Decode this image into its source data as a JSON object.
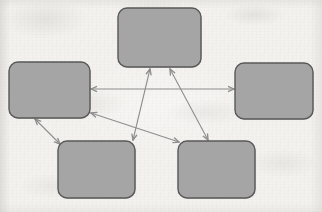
{
  "document": {
    "type": "scanned-diagram",
    "title": "Five-node bidirectional relationship diagram",
    "background_color": "#f3f2ef",
    "paper_texture": "scanned paper with faint gray smudges"
  },
  "style": {
    "node_fill": "#a5a5a5",
    "node_stroke": "#585858",
    "node_stroke_width": 1.4,
    "node_corner_radius": 9,
    "arrow_color": "#8e8e8e",
    "arrow_stroke_width": 1.1,
    "arrowhead_length": 6
  },
  "nodes": [
    {
      "id": "node-top",
      "label": "",
      "position": "top-center",
      "x": 118,
      "y": 8,
      "width": 83,
      "height": 59
    },
    {
      "id": "node-left",
      "label": "",
      "position": "middle-left",
      "x": 9,
      "y": 62,
      "width": 81,
      "height": 56
    },
    {
      "id": "node-right",
      "label": "",
      "position": "middle-right",
      "x": 235,
      "y": 63,
      "width": 78,
      "height": 56
    },
    {
      "id": "node-bottom-left",
      "label": "",
      "position": "bottom-left",
      "x": 58,
      "y": 141,
      "width": 77,
      "height": 57
    },
    {
      "id": "node-bottom-right",
      "label": "",
      "position": "bottom-right",
      "x": 178,
      "y": 141,
      "width": 77,
      "height": 57
    }
  ],
  "connectors": [
    {
      "id": "connector-left-right",
      "from": "node-left",
      "to": "node-right",
      "direction": "bidirectional",
      "x1": 91,
      "y1": 89,
      "x2": 234,
      "y2": 89
    },
    {
      "id": "connector-top-bottomleft",
      "from": "node-top",
      "to": "node-bottom-left",
      "direction": "bidirectional",
      "x1": 150,
      "y1": 69,
      "x2": 133,
      "y2": 140
    },
    {
      "id": "connector-top-bottomright",
      "from": "node-top",
      "to": "node-bottom-right",
      "direction": "bidirectional",
      "x1": 170,
      "y1": 69,
      "x2": 208,
      "y2": 140
    },
    {
      "id": "connector-left-bottomright",
      "from": "node-left",
      "to": "node-bottom-right",
      "direction": "bidirectional",
      "x1": 91,
      "y1": 113,
      "x2": 179,
      "y2": 142
    },
    {
      "id": "connector-left-bottomleft",
      "from": "node-left",
      "to": "node-bottom-left",
      "direction": "bidirectional",
      "x1": 35,
      "y1": 119,
      "x2": 60,
      "y2": 144
    }
  ]
}
